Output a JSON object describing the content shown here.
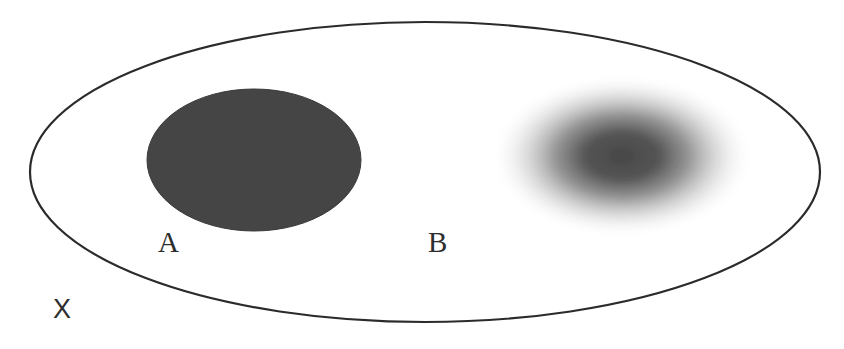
{
  "diagram": {
    "outer_set": {
      "label": "X",
      "shape": "ellipse",
      "stroke_color": "#2b2b2b",
      "fill_color": "#ffffff"
    },
    "regions": [
      {
        "label": "A",
        "style": "sharp",
        "shape": "filled ellipse",
        "fill_color": "#454545"
      },
      {
        "label": "B",
        "style": "fuzzy",
        "shape": "blurred ellipse / gradient",
        "core_color": "#4a4a4a"
      }
    ]
  },
  "labels": {
    "a": "A",
    "b": "B",
    "x": "X"
  },
  "colors": {
    "background": "#ffffff",
    "outline": "#2b2b2b",
    "region_a": "#454545",
    "region_b_core": "#4a4a4a",
    "text": "#2e2e2e"
  }
}
